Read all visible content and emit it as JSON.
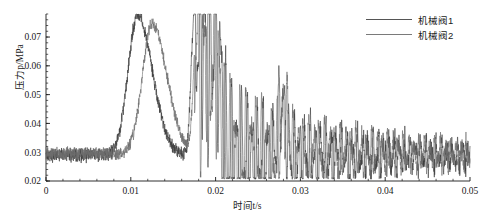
{
  "chart_data": {
    "type": "line",
    "title": "",
    "xlabel": "时间t/s",
    "ylabel": "压力p/MPa",
    "xlim": [
      0,
      0.05
    ],
    "ylim": [
      0.02,
      0.078
    ],
    "grid": false,
    "legend_position": "top-right",
    "xticks": [
      "0",
      "0.01",
      "0.02",
      "0.03",
      "0.04",
      "0.05"
    ],
    "xtick_values": [
      0,
      0.01,
      0.02,
      0.03,
      0.04,
      0.05
    ],
    "yticks": [
      "0.02",
      "0.03",
      "0.04",
      "0.05",
      "0.06",
      "0.07"
    ],
    "ytick_values": [
      0.02,
      0.03,
      0.04,
      0.05,
      0.06,
      0.07
    ],
    "x_minor_ticks_per_interval": 5,
    "y_minor_ticks_per_interval": 5,
    "series": [
      {
        "name": "机械阀1",
        "color": "#3c3c3c",
        "description": "Sharp single pressure peak near t=0.0108 s reaching about 0.0775 MPa, decaying back toward baseline by t=0.017 s, then a strong oscillatory burst starting at t=0.0175 s that decays slowly toward the 0.030 MPa baseline.",
        "baseline": 0.029,
        "noise_amplitude": 0.0018,
        "peaks": [
          {
            "t": 0.0108,
            "p": 0.0775
          },
          {
            "t": 0.0175,
            "p": 0.0775
          },
          {
            "t": 0.0185,
            "p": 0.0705
          },
          {
            "t": 0.0196,
            "p": 0.0645
          },
          {
            "t": 0.0205,
            "p": 0.0575
          },
          {
            "t": 0.0278,
            "p": 0.0465
          }
        ]
      },
      {
        "name": "机械阀2",
        "color": "#6e6e6e",
        "description": "Pressure peak delayed relative to valve 1, peaking near t=0.0125 s at about 0.0745 MPa with a slower decay tail; shares the oscillatory burst after t=0.0175 s and the decaying noisy tail out to t=0.05 s.",
        "baseline": 0.0295,
        "noise_amplitude": 0.0016,
        "peaks": [
          {
            "t": 0.0125,
            "p": 0.0745
          },
          {
            "t": 0.0178,
            "p": 0.076
          },
          {
            "t": 0.019,
            "p": 0.069
          },
          {
            "t": 0.0201,
            "p": 0.062
          },
          {
            "t": 0.0282,
            "p": 0.045
          }
        ]
      }
    ],
    "legend": [
      "机械阀1",
      "机械阀2"
    ]
  },
  "legend": {
    "items": [
      {
        "label": "机械阀1"
      },
      {
        "label": "机械阀2"
      }
    ]
  }
}
